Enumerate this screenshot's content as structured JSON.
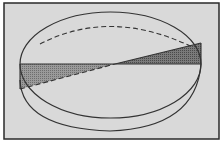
{
  "figure": {
    "colors": {
      "background": "#d8d8d8",
      "frame": "#2a2a2a",
      "line": "#333333",
      "shade": "#8a8a8a",
      "shade_dark": "#6a6a6a"
    }
  }
}
